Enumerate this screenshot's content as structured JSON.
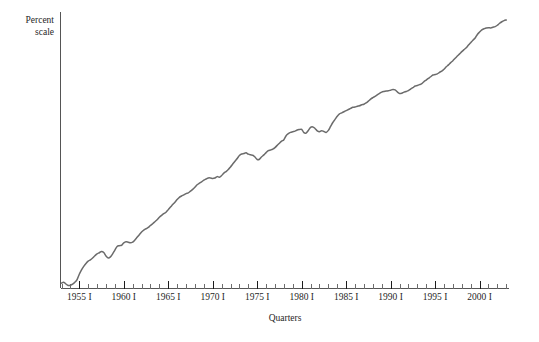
{
  "chart": {
    "ylabel": "Percent\nscale",
    "xlabel": "Quarters"
  },
  "chart_data": {
    "type": "line",
    "title": "",
    "subtitle": "",
    "xlabel": "Quarters",
    "ylabel": "Percent scale",
    "grid": false,
    "legend": null,
    "annotations": [],
    "x_tick_labels": [
      "1955 I",
      "1960 I",
      "1965 I",
      "1970 I",
      "1975 I",
      "1980 I",
      "1985 I",
      "1990 I",
      "1995 I",
      "2000 I"
    ],
    "x_tick_values": [
      1955,
      1960,
      1965,
      1970,
      1975,
      1980,
      1985,
      1990,
      1995,
      2000
    ],
    "x_minor_tick_interval_years": 1,
    "xlim": [
      1953.0,
      2003.25
    ],
    "ylim": [
      0,
      100
    ],
    "y_axis_ticks_shown": false,
    "y_axis_scale_note": "log / percent scale, no numeric tick labels drawn",
    "series": [
      {
        "name": "Real GDP (log percent scale)",
        "x": [
          1953.0,
          1953.25,
          1953.5,
          1953.75,
          1954.0,
          1954.25,
          1954.5,
          1954.75,
          1955.0,
          1955.25,
          1955.5,
          1955.75,
          1956.0,
          1956.25,
          1956.5,
          1956.75,
          1957.0,
          1957.25,
          1957.5,
          1957.75,
          1958.0,
          1958.25,
          1958.5,
          1958.75,
          1959.0,
          1959.25,
          1959.5,
          1959.75,
          1960.0,
          1960.25,
          1960.5,
          1960.75,
          1961.0,
          1961.25,
          1961.5,
          1961.75,
          1962.0,
          1962.25,
          1962.5,
          1962.75,
          1963.0,
          1963.25,
          1963.5,
          1963.75,
          1964.0,
          1964.25,
          1964.5,
          1964.75,
          1965.0,
          1965.25,
          1965.5,
          1965.75,
          1966.0,
          1966.25,
          1966.5,
          1966.75,
          1967.0,
          1967.25,
          1967.5,
          1967.75,
          1968.0,
          1968.25,
          1968.5,
          1968.75,
          1969.0,
          1969.25,
          1969.5,
          1969.75,
          1970.0,
          1970.25,
          1970.5,
          1970.75,
          1971.0,
          1971.25,
          1971.5,
          1971.75,
          1972.0,
          1972.25,
          1972.5,
          1972.75,
          1973.0,
          1973.25,
          1973.5,
          1973.75,
          1974.0,
          1974.25,
          1974.5,
          1974.75,
          1975.0,
          1975.25,
          1975.5,
          1975.75,
          1976.0,
          1976.25,
          1976.5,
          1976.75,
          1977.0,
          1977.25,
          1977.5,
          1977.75,
          1978.0,
          1978.25,
          1978.5,
          1978.75,
          1979.0,
          1979.25,
          1979.5,
          1979.75,
          1980.0,
          1980.25,
          1980.5,
          1980.75,
          1981.0,
          1981.25,
          1981.5,
          1981.75,
          1982.0,
          1982.25,
          1982.5,
          1982.75,
          1983.0,
          1983.25,
          1983.5,
          1983.75,
          1984.0,
          1984.25,
          1984.5,
          1984.75,
          1985.0,
          1985.25,
          1985.5,
          1985.75,
          1986.0,
          1986.25,
          1986.5,
          1986.75,
          1987.0,
          1987.25,
          1987.5,
          1987.75,
          1988.0,
          1988.25,
          1988.5,
          1988.75,
          1989.0,
          1989.25,
          1989.5,
          1989.75,
          1990.0,
          1990.25,
          1990.5,
          1990.75,
          1991.0,
          1991.25,
          1991.5,
          1991.75,
          1992.0,
          1992.25,
          1992.5,
          1992.75,
          1993.0,
          1993.25,
          1993.5,
          1993.75,
          1994.0,
          1994.25,
          1994.5,
          1994.75,
          1995.0,
          1995.25,
          1995.5,
          1995.75,
          1996.0,
          1996.25,
          1996.5,
          1996.75,
          1997.0,
          1997.25,
          1997.5,
          1997.75,
          1998.0,
          1998.25,
          1998.5,
          1998.75,
          1999.0,
          1999.25,
          1999.5,
          1999.75,
          2000.0,
          2000.25,
          2000.5,
          2000.75,
          2001.0,
          2001.25,
          2001.5,
          2001.75,
          2002.0,
          2002.25,
          2002.5,
          2002.75,
          2003.0
        ],
        "values": [
          2.0,
          2.4,
          1.6,
          0.9,
          1.0,
          1.5,
          2.4,
          3.6,
          6.0,
          8.0,
          9.6,
          10.9,
          12.0,
          12.6,
          13.4,
          14.4,
          15.3,
          15.8,
          16.4,
          15.9,
          14.3,
          13.4,
          13.9,
          15.3,
          17.0,
          18.6,
          19.0,
          19.2,
          20.3,
          20.8,
          20.6,
          20.3,
          20.6,
          21.6,
          22.8,
          24.0,
          25.2,
          26.1,
          26.7,
          27.3,
          28.2,
          29.0,
          29.9,
          30.8,
          31.9,
          32.8,
          33.6,
          34.2,
          35.4,
          36.6,
          37.7,
          38.8,
          40.0,
          41.0,
          41.6,
          42.1,
          42.7,
          43.0,
          43.8,
          44.6,
          45.6,
          46.7,
          47.4,
          48.0,
          48.8,
          49.3,
          49.8,
          49.8,
          49.6,
          49.8,
          50.4,
          50.1,
          50.9,
          52.0,
          52.7,
          53.6,
          54.8,
          56.1,
          57.4,
          58.6,
          60.0,
          60.7,
          60.9,
          61.2,
          60.6,
          60.3,
          60.1,
          59.3,
          58.2,
          58.3,
          59.4,
          60.3,
          61.3,
          62.2,
          62.5,
          62.9,
          63.6,
          64.6,
          65.6,
          66.5,
          67.2,
          69.0,
          69.9,
          70.5,
          70.8,
          71.1,
          71.6,
          71.8,
          71.9,
          70.4,
          70.2,
          71.4,
          72.8,
          73.0,
          72.3,
          71.2,
          70.8,
          71.3,
          70.9,
          70.5,
          71.4,
          73.2,
          75.0,
          76.4,
          77.8,
          78.9,
          79.4,
          79.9,
          80.4,
          80.9,
          81.4,
          81.9,
          82.0,
          82.4,
          82.6,
          83.1,
          83.3,
          83.9,
          84.7,
          85.6,
          86.3,
          86.9,
          87.6,
          88.2,
          88.8,
          89.1,
          89.3,
          89.4,
          89.7,
          90.0,
          89.8,
          88.9,
          88.2,
          88.3,
          88.8,
          89.1,
          89.5,
          90.2,
          90.8,
          91.6,
          91.8,
          92.2,
          92.7,
          93.6,
          94.3,
          95.1,
          95.8,
          96.6,
          96.8,
          97.1,
          97.8,
          98.4,
          99.2,
          100.3,
          101.2,
          102.2,
          103.1,
          104.2,
          105.2,
          106.2,
          107.2,
          108.1,
          109.0,
          110.2,
          111.3,
          112.4,
          113.4,
          115.0,
          116.1,
          117.1,
          117.6,
          118.0,
          118.1,
          118.0,
          118.3,
          118.6,
          119.2,
          120.1,
          120.8,
          121.3,
          121.6
        ]
      }
    ]
  }
}
